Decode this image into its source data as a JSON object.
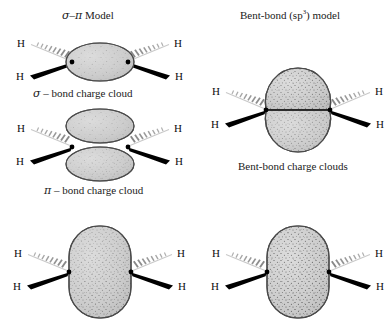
{
  "figure": {
    "type": "chemistry-bonding-diagram",
    "molecule": "ethylene C2H4",
    "background_color": "#ffffff",
    "cloud_fill_color": "#cccccc",
    "cloud_stroke_color": "#4d4d4d",
    "stipple_color": "#333333",
    "wedge_color": "#000000",
    "hash_color": "#b3b3b3"
  },
  "columns": {
    "left": {
      "heading": "σ–π Model",
      "heading_parts": {
        "sigma": "σ",
        "dash": "–",
        "pi": "π",
        "word": "Model"
      }
    },
    "right": {
      "heading_prefix": "Bent-bond (sp",
      "heading_sup": "3",
      "heading_suffix": ") model"
    }
  },
  "captions": {
    "sigma_cloud": "σ – bond charge cloud",
    "sigma_symbol": "σ",
    "sigma_rest": "– bond charge cloud",
    "pi_cloud": "π – bond charge cloud",
    "pi_symbol": "π",
    "pi_rest": "– bond charge cloud",
    "bent_clouds": "Bent-bond charge clouds"
  },
  "panels": [
    {
      "id": "sigma-bond",
      "name": "sigma-bond-charge-cloud",
      "cloud_shape": "single-horizontal-ellipse",
      "cloud_count": 1,
      "hydrogens": [
        {
          "label": "H",
          "position": "upper-left",
          "bond": "hashed-wedge"
        },
        {
          "label": "H",
          "position": "lower-left",
          "bond": "solid-wedge"
        },
        {
          "label": "H",
          "position": "upper-right",
          "bond": "hashed-wedge"
        },
        {
          "label": "H",
          "position": "lower-right",
          "bond": "solid-wedge"
        }
      ],
      "carbons": 2
    },
    {
      "id": "pi-bond",
      "name": "pi-bond-charge-cloud",
      "cloud_shape": "two-stacked-horizontal-ellipses",
      "cloud_count": 2,
      "hydrogens": [
        {
          "label": "H",
          "position": "upper-left",
          "bond": "hashed-wedge"
        },
        {
          "label": "H",
          "position": "lower-left",
          "bond": "solid-wedge"
        },
        {
          "label": "H",
          "position": "upper-right",
          "bond": "hashed-wedge"
        },
        {
          "label": "H",
          "position": "lower-right",
          "bond": "solid-wedge"
        }
      ],
      "carbons": 2
    },
    {
      "id": "bent-bond",
      "name": "bent-bond-charge-clouds",
      "cloud_shape": "two-stacked-banana-lobes",
      "cloud_count": 2,
      "hydrogens": [
        {
          "label": "H",
          "position": "upper-left",
          "bond": "hashed-wedge"
        },
        {
          "label": "H",
          "position": "lower-left",
          "bond": "solid-wedge"
        },
        {
          "label": "H",
          "position": "upper-right",
          "bond": "hashed-wedge"
        },
        {
          "label": "H",
          "position": "lower-right",
          "bond": "solid-wedge"
        }
      ],
      "carbons": 2
    },
    {
      "id": "sigma-pi-combined",
      "name": "sigma-pi-combined-cloud",
      "cloud_shape": "single-tall-rounded-ellipse",
      "cloud_count": 1,
      "hydrogens": [
        {
          "label": "H",
          "position": "upper-left",
          "bond": "hashed-wedge"
        },
        {
          "label": "H",
          "position": "lower-left",
          "bond": "solid-wedge"
        },
        {
          "label": "H",
          "position": "upper-right",
          "bond": "hashed-wedge"
        },
        {
          "label": "H",
          "position": "lower-right",
          "bond": "solid-wedge"
        }
      ],
      "carbons": 2
    },
    {
      "id": "bent-bond-combined",
      "name": "bent-bond-combined-cloud",
      "cloud_shape": "single-tall-rounded-ellipse",
      "cloud_count": 1,
      "hydrogens": [
        {
          "label": "H",
          "position": "upper-left",
          "bond": "hashed-wedge"
        },
        {
          "label": "H",
          "position": "lower-left",
          "bond": "solid-wedge"
        },
        {
          "label": "H",
          "position": "upper-right",
          "bond": "hashed-wedge"
        },
        {
          "label": "H",
          "position": "lower-right",
          "bond": "solid-wedge"
        }
      ],
      "carbons": 2
    }
  ],
  "atoms": {
    "hydrogen": "H",
    "carbon_marker": "dot"
  }
}
